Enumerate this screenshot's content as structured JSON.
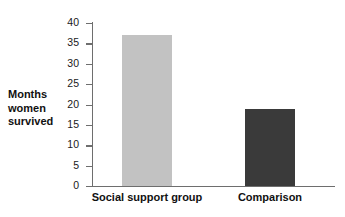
{
  "chart_data": {
    "type": "bar",
    "title": "",
    "xlabel": "",
    "ylabel": "Months women survived",
    "ylabel_lines": [
      "Months",
      "women",
      "survived"
    ],
    "categories": [
      "Social support group",
      "Comparison"
    ],
    "values": [
      37,
      19
    ],
    "ylim": [
      0,
      40
    ],
    "yticks": [
      0,
      5,
      10,
      15,
      20,
      25,
      30,
      35,
      40
    ],
    "ytick_labels": [
      "0",
      "5",
      "10",
      "15",
      "20",
      "25",
      "30",
      "35",
      "40"
    ],
    "grid": false,
    "legend": "none",
    "bar_colors": [
      "#c2c2c2",
      "#3a3a3a"
    ],
    "axis_color": "#6e6e6e",
    "background": "#ffffff"
  }
}
